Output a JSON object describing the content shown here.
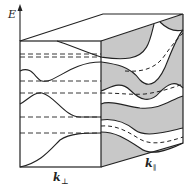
{
  "diagram": {
    "axis_label_energy": "E",
    "axis_label_k_perp": "k",
    "axis_label_k_perp_sub": "⊥",
    "axis_label_k_par": "k",
    "axis_label_k_par_sub": "∥"
  },
  "colors": {
    "line": "#222222",
    "shade": "#c8c8c8",
    "background": "#ffffff"
  }
}
